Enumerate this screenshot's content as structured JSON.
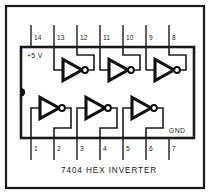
{
  "figure": {
    "caption": "7404  HEX INVERTER",
    "part_number": "7404",
    "device_name": "HEX INVERTER",
    "power_label": "+5 V",
    "ground_label": "GND",
    "colors": {
      "ink": "#1b1b1b",
      "background": "#ffffff",
      "gate_outline": "#101010"
    }
  },
  "pins": {
    "top_row": [
      {
        "number": "14",
        "x": 31
      },
      {
        "number": "13",
        "x": 54
      },
      {
        "number": "12",
        "x": 77
      },
      {
        "number": "11",
        "x": 100
      },
      {
        "number": "10",
        "x": 123
      },
      {
        "number": "9",
        "x": 146
      },
      {
        "number": "8",
        "x": 169
      }
    ],
    "bottom_row": [
      {
        "number": "1",
        "x": 31
      },
      {
        "number": "2",
        "x": 54
      },
      {
        "number": "3",
        "x": 77
      },
      {
        "number": "4",
        "x": 100
      },
      {
        "number": "5",
        "x": 123
      },
      {
        "number": "6",
        "x": 146
      },
      {
        "number": "7",
        "x": 169
      }
    ]
  },
  "gates": {
    "top": [
      {
        "id": "gate-top-1",
        "input_pin": "13",
        "output_pin": "12"
      },
      {
        "id": "gate-top-2",
        "input_pin": "11",
        "output_pin": "10"
      },
      {
        "id": "gate-top-3",
        "input_pin": "9",
        "output_pin": "8"
      }
    ],
    "bottom": [
      {
        "id": "gate-bottom-1",
        "input_pin": "1",
        "output_pin": "2"
      },
      {
        "id": "gate-bottom-2",
        "input_pin": "3",
        "output_pin": "4"
      },
      {
        "id": "gate-bottom-3",
        "input_pin": "5",
        "output_pin": "6"
      }
    ]
  }
}
